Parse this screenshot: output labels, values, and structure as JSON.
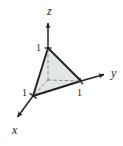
{
  "figure": {
    "background_color": "#ffffff"
  },
  "axes": {
    "z": {
      "label": "z",
      "direction": "up",
      "label_x": 47,
      "label_y": 15,
      "tick": {
        "label": "1",
        "x": 36,
        "y": 51
      }
    },
    "y": {
      "label": "y",
      "direction": "right",
      "label_x": 111,
      "label_y": 77,
      "tick": {
        "label": "1",
        "x": 77,
        "y": 96
      }
    },
    "x": {
      "label": "x",
      "direction": "down-left",
      "label_x": 12,
      "label_y": 134,
      "tick": {
        "label": "1",
        "x": 22,
        "y": 96
      }
    }
  },
  "shape": {
    "name": "triangle-plane-x-plus-y-plus-z-equals-1",
    "fill_color": "#dfe2e4",
    "stroke_color": "#231f20",
    "hidden_edge_style": "dashed",
    "vertices": {
      "z_intercept": {
        "x": 48,
        "y": 48
      },
      "y_intercept": {
        "x": 81,
        "y": 81
      },
      "x_intercept": {
        "x": 33,
        "y": 96
      },
      "origin": {
        "x": 48,
        "y": 80
      }
    }
  },
  "colors": {
    "ink": "#231f20",
    "fill": "#dfe2e4",
    "paper": "#ffffff"
  }
}
